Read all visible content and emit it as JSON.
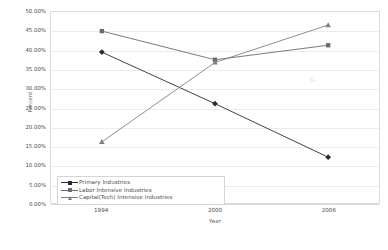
{
  "chart_data": {
    "type": "line",
    "title": "",
    "xlabel": "Year",
    "ylabel": "Percent",
    "categories": [
      "1994",
      "2000",
      "2006"
    ],
    "x": [
      1994,
      2000,
      2006
    ],
    "ylim": [
      0,
      50
    ],
    "ytick_step": 5,
    "ytick_labels": [
      "50.00%",
      "45.00%",
      "40.00%",
      "35.00%",
      "30.00%",
      "25.00%",
      "20.00%",
      "15.00%",
      "10.00%",
      "5.00%",
      "0.00%"
    ],
    "ytick_values": [
      50,
      45,
      40,
      35,
      30,
      25,
      20,
      15,
      10,
      5,
      0
    ],
    "grid": "horizontal",
    "legend_position": "inside-bottom-left",
    "series": [
      {
        "name": "Primary Industries",
        "marker": "diamond",
        "color": "#2b2b2b",
        "values": [
          39.5,
          26.0,
          12.0
        ]
      },
      {
        "name": "Labor Intensive Industries",
        "marker": "square",
        "color": "#6b6b6b",
        "values": [
          45.0,
          37.5,
          41.3
        ]
      },
      {
        "name": "Capital(Tech) Intensive Industries",
        "marker": "triangle",
        "color": "#808080",
        "values": [
          16.0,
          36.8,
          46.6
        ]
      }
    ]
  }
}
